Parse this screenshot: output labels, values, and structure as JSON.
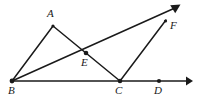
{
  "figure": {
    "kind": "geometry-diagram",
    "canvas": {
      "width": 198,
      "height": 100,
      "background": "#ffffff"
    },
    "style": {
      "stroke_color": "#1a1a1a",
      "stroke_width": 1.2,
      "baseline_stroke_width": 1.6,
      "point_radius": 2.1,
      "label_color": "#1a1a1a",
      "label_font_size": 11
    },
    "points": [
      {
        "id": "A",
        "label": "A",
        "x": 53,
        "y": 26,
        "dot": false,
        "label_x": 47,
        "label_y": 8
      },
      {
        "id": "B",
        "label": "B",
        "x": 12,
        "y": 81,
        "dot": true,
        "label_x": 8,
        "label_y": 85
      },
      {
        "id": "C",
        "label": "C",
        "x": 120,
        "y": 81,
        "dot": true,
        "label_x": 115,
        "label_y": 85
      },
      {
        "id": "D",
        "label": "D",
        "x": 159,
        "y": 81,
        "dot": true,
        "label_x": 154,
        "label_y": 85
      },
      {
        "id": "E",
        "label": "E",
        "x": 86,
        "y": 53,
        "dot": true,
        "label_x": 81,
        "label_y": 57
      },
      {
        "id": "F",
        "label": "F",
        "x": 165,
        "y": 22,
        "dot": false,
        "label_x": 170,
        "label_y": 20
      }
    ],
    "segments": [
      {
        "id": "BA",
        "from": "B",
        "to": "A",
        "x1": 12,
        "y1": 81,
        "x2": 53,
        "y2": 26
      },
      {
        "id": "AC",
        "from": "A",
        "to": "C",
        "x1": 53,
        "y1": 26,
        "x2": 120,
        "y2": 81
      },
      {
        "id": "BC",
        "from": "B",
        "to": "C",
        "x1": 12,
        "y1": 81,
        "x2": 120,
        "y2": 81
      },
      {
        "id": "CF",
        "from": "C",
        "to": "F",
        "x1": 120,
        "y1": 81,
        "x2": 165,
        "y2": 22
      }
    ],
    "rays": [
      {
        "id": "ray-BF",
        "from": "B",
        "through": "F",
        "x1": 12,
        "y1": 81,
        "x2": 178,
        "y2": 6,
        "arrow": true,
        "arrow_label": "ray-bf-arrowhead"
      },
      {
        "id": "ray-BD",
        "from": "B",
        "through": "D",
        "x1": 12,
        "y1": 81,
        "x2": 191,
        "y2": 81,
        "arrow": true,
        "arrow_label": "baseline-arrowhead"
      }
    ],
    "labels_order": [
      "A",
      "F",
      "E",
      "B",
      "C",
      "D"
    ]
  }
}
